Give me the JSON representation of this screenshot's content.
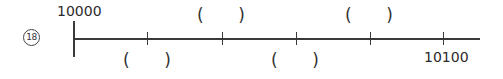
{
  "question_number": "18",
  "number_line": {
    "start_label": "10000",
    "end_label": "10100",
    "tick_count_between": 4,
    "blanks": [
      {
        "position": 1,
        "side": "below",
        "open": "(",
        "close": ")"
      },
      {
        "position": 2,
        "side": "above",
        "open": "(",
        "close": ")"
      },
      {
        "position": 3,
        "side": "below",
        "open": "(",
        "close": ")"
      },
      {
        "position": 4,
        "side": "above",
        "open": "(",
        "close": ")"
      }
    ]
  }
}
